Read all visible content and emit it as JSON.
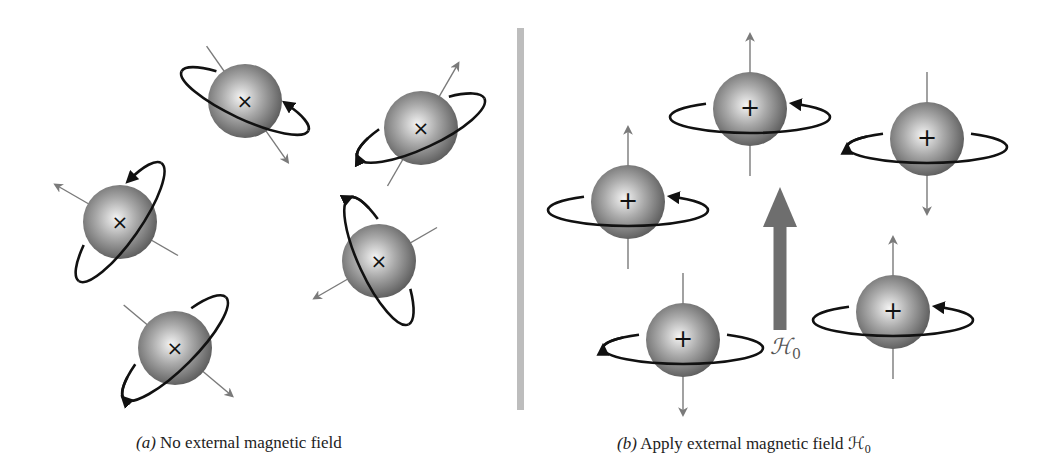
{
  "figure": {
    "colors": {
      "background": "#ffffff",
      "divider": "#bdbdbd",
      "axis": "#7a7a7a",
      "orbit": "#111111",
      "field_arrow": "#6e6e6e",
      "sphere_light": "#f2f2f2",
      "sphere_mid": "#a8a8a8",
      "sphere_dark": "#5c5c5c"
    },
    "divider": {
      "x": 517,
      "y1": 28,
      "y2": 410,
      "width": 7
    }
  },
  "panel_a": {
    "caption_prefix": "(a)",
    "caption_text": " No external magnetic field",
    "nuclei": [
      {
        "id": "a1",
        "cx": 245,
        "cy": 101,
        "r": 37,
        "sign": "×",
        "axis_angle": 55,
        "spin": "up",
        "orbit_rx": 70,
        "orbit_ry": 18,
        "orbit_rot": 25,
        "arrow_side": "right"
      },
      {
        "id": "a2",
        "cx": 421,
        "cy": 128,
        "r": 37,
        "sign": "×",
        "axis_angle": -60,
        "spin": "down",
        "orbit_rx": 70,
        "orbit_ry": 20,
        "orbit_rot": -25,
        "arrow_side": "left"
      },
      {
        "id": "a3",
        "cx": 120,
        "cy": 222,
        "r": 37,
        "sign": "×",
        "axis_angle": -150,
        "spin": "up",
        "orbit_rx": 72,
        "orbit_ry": 20,
        "orbit_rot": -55,
        "arrow_side": "top"
      },
      {
        "id": "a4",
        "cx": 379,
        "cy": 261,
        "r": 37,
        "sign": "×",
        "axis_angle": 150,
        "spin": "down",
        "orbit_rx": 70,
        "orbit_ry": 20,
        "orbit_rot": 65,
        "arrow_side": "top"
      },
      {
        "id": "a5",
        "cx": 175,
        "cy": 348,
        "r": 37,
        "sign": "×",
        "axis_angle": 40,
        "spin": "down",
        "orbit_rx": 72,
        "orbit_ry": 20,
        "orbit_rot": -45,
        "arrow_side": "bottom"
      }
    ]
  },
  "panel_b": {
    "caption_prefix": "(b)",
    "caption_text": " Apply external magnetic field ",
    "caption_symbol": "ℋ",
    "caption_subscript": "0",
    "field_symbol": "ℋ",
    "field_subscript": "0",
    "field_arrow": {
      "x": 780,
      "y_top": 187,
      "y_bottom": 330,
      "shaft_width": 13,
      "head_width": 34,
      "head_height": 40
    },
    "nuclei": [
      {
        "id": "b1",
        "cx": 750,
        "cy": 109,
        "r": 37,
        "sign": "+",
        "spin": "up"
      },
      {
        "id": "b2",
        "cx": 927,
        "cy": 139,
        "r": 37,
        "sign": "+",
        "spin": "down"
      },
      {
        "id": "b3",
        "cx": 628,
        "cy": 202,
        "r": 37,
        "sign": "+",
        "spin": "up"
      },
      {
        "id": "b4",
        "cx": 893,
        "cy": 312,
        "r": 37,
        "sign": "+",
        "spin": "up"
      },
      {
        "id": "b5",
        "cx": 683,
        "cy": 340,
        "r": 37,
        "sign": "+",
        "spin": "down"
      }
    ]
  }
}
